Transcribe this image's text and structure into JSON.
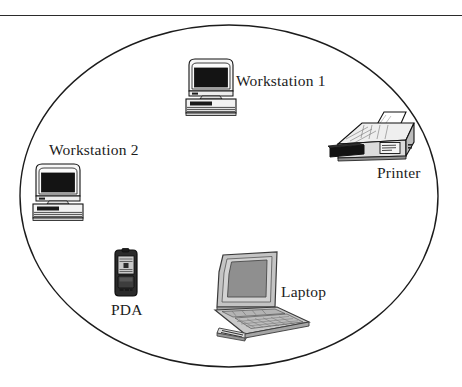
{
  "figure": {
    "type": "network-topology-diagram",
    "background_color": "#ffffff",
    "boundary": {
      "shape": "ellipse",
      "name": "network-boundary",
      "stroke_color": "#1c1c1c",
      "cx": 229,
      "cy": 196,
      "rx": 209,
      "ry": 171
    },
    "top_rule": {
      "color": "#2b2b2b",
      "y": 15
    }
  },
  "nodes": [
    {
      "id": "workstation-1",
      "icon": "desktop-computer-icon",
      "label": "Workstation 1",
      "label_x": 236,
      "label_y": 72,
      "icon_x": 182,
      "icon_y": 55,
      "icon_w": 58,
      "icon_h": 64
    },
    {
      "id": "printer",
      "icon": "laser-printer-icon",
      "label": "Printer",
      "label_x": 377,
      "label_y": 164,
      "icon_x": 330,
      "icon_y": 112,
      "icon_w": 90,
      "icon_h": 50
    },
    {
      "id": "workstation-2",
      "icon": "desktop-computer-icon",
      "label": "Workstation 2",
      "label_x": 49,
      "label_y": 141,
      "icon_x": 29,
      "icon_y": 160,
      "icon_w": 58,
      "icon_h": 64
    },
    {
      "id": "pda",
      "icon": "pda-handheld-icon",
      "label": "PDA",
      "label_x": 111,
      "label_y": 301,
      "icon_x": 112,
      "icon_y": 249,
      "icon_w": 28,
      "icon_h": 48
    },
    {
      "id": "laptop",
      "icon": "laptop-computer-icon",
      "label": "Laptop",
      "label_x": 281,
      "label_y": 283,
      "icon_x": 207,
      "icon_y": 252,
      "icon_w": 105,
      "icon_h": 92
    }
  ],
  "colors": {
    "ink": "#1c1c1c",
    "outline": "#111111",
    "screen_dark": "#141414",
    "case_light": "#f6f6f6",
    "case_mid": "#d8d8d8",
    "case_shadow": "#9a9a9a",
    "laptop_body": "#bdbdbd",
    "laptop_screen": "#8f8f8f",
    "pda_body": "#2a2a2a",
    "printer_tray": "#131313"
  }
}
